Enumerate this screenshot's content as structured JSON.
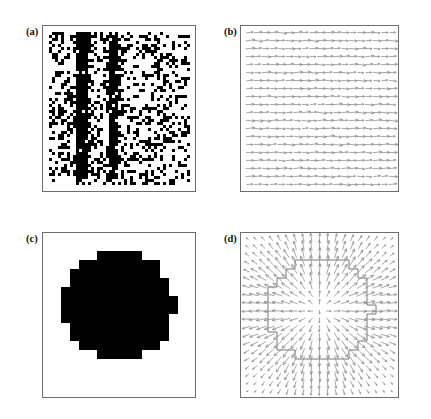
{
  "figure": {
    "background_color": "#ffffff",
    "frame_color": "#6e6e72",
    "ink_color": "#000000",
    "arrow_color": "#8a8a8e",
    "contour_color": "#6a6a6e",
    "width": 431,
    "height": 419
  },
  "panels": [
    {
      "id": "panel-a",
      "label": "(a)",
      "type": "binary-speckle-image",
      "label_x": 26,
      "label_y": 27,
      "frame_x": 42,
      "frame_y": 25,
      "frame_w": 154,
      "frame_h": 167,
      "description": "Noisy binary speckle pattern with two dark vertical line features",
      "content": {
        "noise_density": 0.3,
        "pixel_block": 3,
        "vertical_features": [
          {
            "x_frac": 0.25,
            "y_top_frac": 0.04,
            "y_bottom_frac": 0.93,
            "width_frac": 0.035,
            "strength": 0.95
          },
          {
            "x_frac": 0.47,
            "y_top_frac": 0.04,
            "y_bottom_frac": 0.93,
            "width_frac": 0.03,
            "strength": 0.92
          }
        ]
      }
    },
    {
      "id": "panel-b",
      "label": "(b)",
      "type": "quiver-vector-field",
      "label_x": 224,
      "label_y": 27,
      "frame_x": 240,
      "frame_y": 25,
      "frame_w": 159,
      "frame_h": 167,
      "description": "Regular grid of small near-horizontal arrows, uniform weak vector field",
      "content": {
        "grid_cols": 19,
        "grid_rows": 20,
        "arrow_length": 6.0,
        "arrow_jitter_deg": 16,
        "base_angle_deg": 0,
        "has_contour": false
      }
    },
    {
      "id": "panel-c",
      "label": "(c)",
      "type": "binary-mask-image",
      "label_x": 26,
      "label_y": 234,
      "frame_x": 42,
      "frame_y": 232,
      "frame_w": 154,
      "frame_h": 166,
      "description": "Solid black pixelated disk centered in the frame",
      "content": {
        "shape": "pixelated-disk",
        "center_x_frac": 0.5,
        "center_y_frac": 0.44,
        "radius_frac": 0.235,
        "pixel_block": 9
      }
    },
    {
      "id": "panel-d",
      "label": "(d)",
      "type": "quiver-vector-field-with-contour",
      "label_x": 224,
      "label_y": 234,
      "frame_x": 240,
      "frame_y": 232,
      "frame_w": 159,
      "frame_h": 166,
      "description": "Quiver field with blocky contour outline of the disk; arrows radiate outward near the boundary",
      "content": {
        "grid_cols": 19,
        "grid_rows": 20,
        "arrow_length": 6.0,
        "arrow_jitter_deg": 10,
        "has_contour": true,
        "contour": {
          "center_x_frac": 0.5,
          "center_y_frac": 0.47,
          "radius_frac": 0.215,
          "pixel_block": 9
        },
        "radial_field": {
          "center_x_frac": 0.5,
          "center_y_frac": 0.47,
          "peak_radius_frac": 0.2,
          "falloff_frac": 0.17,
          "max_length": 8.0
        }
      }
    }
  ]
}
